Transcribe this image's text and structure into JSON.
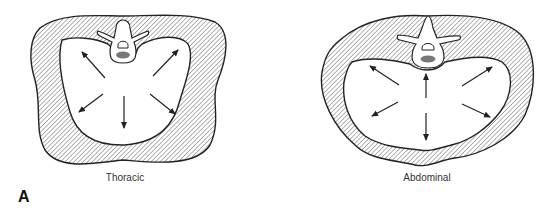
{
  "figure": {
    "panel_label": "A",
    "diagrams": [
      {
        "id": "thoracic",
        "caption": "Thoracic",
        "arrow_count": 5
      },
      {
        "id": "abdominal",
        "caption": "Abdominal",
        "arrow_count": 6
      }
    ],
    "colors": {
      "stroke": "#222222",
      "hatch": "#555555",
      "background": "#ffffff"
    }
  }
}
